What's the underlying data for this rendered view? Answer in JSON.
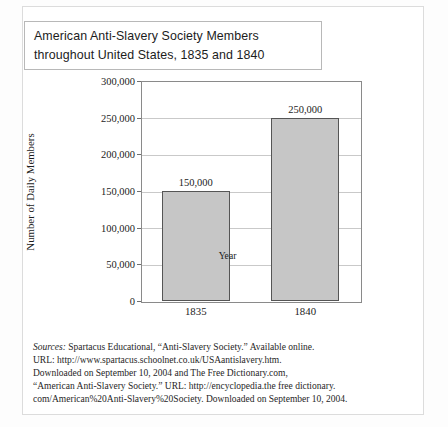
{
  "title": {
    "line1": "American Anti-Slavery Society Members",
    "line2": "throughout United States, 1835 and 1840"
  },
  "chart_data": {
    "type": "bar",
    "title": "American Anti-Slavery Society Members throughout United States, 1835 and 1840",
    "categories": [
      "1835",
      "1840"
    ],
    "values": [
      150000,
      250000
    ],
    "data_labels": [
      "150,000",
      "250,000"
    ],
    "xlabel": "Year",
    "ylabel": "Number of Daily Members",
    "ylim": [
      0,
      300000
    ],
    "ytick_values": [
      0,
      50000,
      100000,
      150000,
      200000,
      250000,
      300000
    ],
    "ytick_labels": [
      "0",
      "50,000",
      "100,000",
      "150,000",
      "200,000",
      "250,000",
      "300,000"
    ],
    "grid": true,
    "legend": "none",
    "bar_fill": "#c6c6c6",
    "bar_edge": "#555555"
  },
  "sources": {
    "lead": "Sources:",
    "line1_rest": " Spartacus Educational, “Anti-Slavery Society.” Available online.",
    "line2": "URL: http://www.spartacus.schoolnet.co.uk/USAantislavery.htm.",
    "line3": "Downloaded on September 10, 2004 and The Free Dictionary.com,",
    "line4": "“American Anti-Slavery Society.” URL: http://encyclopedia.the free dictionary.",
    "line5": "com/American%20Anti-Slavery%20Society. Downloaded on September 10, 2004."
  }
}
